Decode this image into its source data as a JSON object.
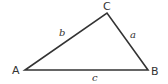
{
  "diagram": {
    "type": "triangle",
    "stroke_color": "#333333",
    "vertices": [
      {
        "label": "A",
        "x": 25,
        "y": 70
      },
      {
        "label": "B",
        "x": 148,
        "y": 70
      },
      {
        "label": "C",
        "x": 107,
        "y": 13
      }
    ],
    "sides": [
      {
        "label": "a",
        "between": "B-C"
      },
      {
        "label": "b",
        "between": "A-C"
      },
      {
        "label": "c",
        "between": "A-B"
      }
    ]
  }
}
